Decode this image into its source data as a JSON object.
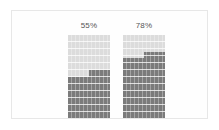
{
  "top_strip": {
    "cutoff_text": "· ·· ·· ···· ·· · ·· ·· · ·· ·",
    "note": "clipped line of gray text above the card"
  },
  "card": {
    "background_color": "#fefefe",
    "border_color": "#e7e7e7"
  },
  "chart_data": {
    "type": "bar",
    "title": "",
    "subtitle": "",
    "xlabel": "",
    "ylabel": "",
    "ylim": [
      0,
      100
    ],
    "grid": false,
    "legend": null,
    "orientation": "vertical",
    "style": "segmented-fill",
    "unit": "%",
    "categories": [
      "",
      ""
    ],
    "values": [
      55,
      78
    ],
    "data_labels": [
      "55%",
      "78%"
    ],
    "series": [
      {
        "name": "fill",
        "values": [
          55,
          78
        ]
      }
    ],
    "segment_detail": {
      "description": "each bar is split into a left and right half; the right half fills one segment higher than the left, producing a notch",
      "left_half_values": [
        50,
        72
      ],
      "right_half_values": [
        58,
        80
      ]
    },
    "colors": {
      "filled": "#7b7b7b",
      "unfilled": "#dcdcdc",
      "track": "#d9d9d9",
      "segment_divider": "#ffffff",
      "label_text": "#555555"
    }
  }
}
